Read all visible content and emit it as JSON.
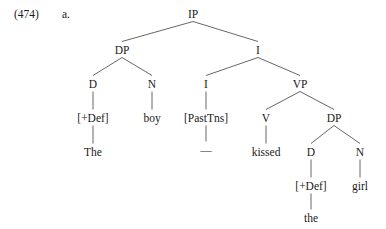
{
  "example": {
    "number": "(474)",
    "letter": "a."
  },
  "tree": {
    "sentence": "The boy kissed the girl",
    "nodes": [
      {
        "id": "IP",
        "label": "IP",
        "x": 193,
        "y": 8,
        "kind": "category"
      },
      {
        "id": "DP1",
        "label": "DP",
        "x": 122,
        "y": 44,
        "kind": "category"
      },
      {
        "id": "Ibar",
        "label": "I",
        "x": 258,
        "y": 44,
        "kind": "category"
      },
      {
        "id": "D1",
        "label": "D",
        "x": 93,
        "y": 78,
        "kind": "category"
      },
      {
        "id": "N1",
        "label": "N",
        "x": 152,
        "y": 78,
        "kind": "category"
      },
      {
        "id": "I0",
        "label": "I",
        "x": 206,
        "y": 78,
        "kind": "category"
      },
      {
        "id": "VP",
        "label": "VP",
        "x": 300,
        "y": 78,
        "kind": "category"
      },
      {
        "id": "Def1",
        "label": "[+Def]",
        "x": 93,
        "y": 112,
        "kind": "feature"
      },
      {
        "id": "boy",
        "label": "boy",
        "x": 152,
        "y": 112,
        "kind": "feature"
      },
      {
        "id": "PastTns",
        "label": "[PastTns]",
        "x": 206,
        "y": 112,
        "kind": "feature"
      },
      {
        "id": "V",
        "label": "V",
        "x": 266,
        "y": 112,
        "kind": "category"
      },
      {
        "id": "DP2",
        "label": "DP",
        "x": 334,
        "y": 112,
        "kind": "category"
      },
      {
        "id": "The",
        "label": "The",
        "x": 93,
        "y": 146,
        "kind": "lexical"
      },
      {
        "id": "trace",
        "label": "—",
        "x": 206,
        "y": 144,
        "kind": "trace"
      },
      {
        "id": "kissed",
        "label": "kissed",
        "x": 266,
        "y": 146,
        "kind": "lexical"
      },
      {
        "id": "D2",
        "label": "D",
        "x": 311,
        "y": 146,
        "kind": "category"
      },
      {
        "id": "N2",
        "label": "N",
        "x": 360,
        "y": 146,
        "kind": "category"
      },
      {
        "id": "Def2",
        "label": "[+Def]",
        "x": 311,
        "y": 180,
        "kind": "feature"
      },
      {
        "id": "girl",
        "label": "girl",
        "x": 360,
        "y": 180,
        "kind": "lexical"
      },
      {
        "id": "the",
        "label": "the",
        "x": 311,
        "y": 212,
        "kind": "lexical"
      }
    ],
    "edges": [
      {
        "from": "IP",
        "to": "DP1"
      },
      {
        "from": "IP",
        "to": "Ibar"
      },
      {
        "from": "DP1",
        "to": "D1"
      },
      {
        "from": "DP1",
        "to": "N1"
      },
      {
        "from": "Ibar",
        "to": "I0"
      },
      {
        "from": "Ibar",
        "to": "VP"
      },
      {
        "from": "D1",
        "to": "Def1"
      },
      {
        "from": "N1",
        "to": "boy"
      },
      {
        "from": "I0",
        "to": "PastTns"
      },
      {
        "from": "VP",
        "to": "V"
      },
      {
        "from": "VP",
        "to": "DP2"
      },
      {
        "from": "Def1",
        "to": "The"
      },
      {
        "from": "PastTns",
        "to": "trace"
      },
      {
        "from": "V",
        "to": "kissed"
      },
      {
        "from": "DP2",
        "to": "D2"
      },
      {
        "from": "DP2",
        "to": "N2"
      },
      {
        "from": "D2",
        "to": "Def2"
      },
      {
        "from": "N2",
        "to": "girl"
      },
      {
        "from": "Def2",
        "to": "the"
      }
    ]
  },
  "style": {
    "line_color": "#555555",
    "text_color": "#1a1a1a",
    "background": "#ffffff"
  }
}
